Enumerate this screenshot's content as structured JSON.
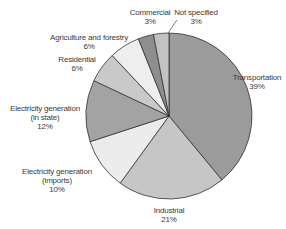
{
  "chart_data": {
    "type": "pie",
    "title": "",
    "start_angle_deg": 0,
    "direction": "clockwise",
    "center": [
      169,
      116
    ],
    "radius": 83,
    "slices": [
      {
        "name": "Transportation",
        "value": 39,
        "label": "39%",
        "color": "#9b9b9b"
      },
      {
        "name": "Industrial",
        "value": 21,
        "label": "21%",
        "color": "#c6c6c6"
      },
      {
        "name": "Electricity generation (imports)",
        "value": 10,
        "label": "10%",
        "color": "#ececec"
      },
      {
        "name": "Electricity generation (in state)",
        "value": 12,
        "label": "12%",
        "color": "#a3a3a3"
      },
      {
        "name": "Residential",
        "value": 6,
        "label": "6%",
        "color": "#c9c9c9"
      },
      {
        "name": "Agriculture and forestry",
        "value": 6,
        "label": "6%",
        "color": "#eeeeee"
      },
      {
        "name": "Commercial",
        "value": 3,
        "label": "3%",
        "color": "#8e8e8e"
      },
      {
        "name": "Not specified",
        "value": 3,
        "label": "3%",
        "color": "#c2c2c2"
      }
    ]
  },
  "labels": {
    "transportation": {
      "line1": "Transportation",
      "pct": "39%"
    },
    "industrial": {
      "line1": "Industrial",
      "pct": "21%"
    },
    "elec_imports": {
      "line1": "Electricity generation",
      "line2": "(imports)",
      "pct": "10%"
    },
    "elec_instate": {
      "line1": "Electricity generation",
      "line2": "(in state)",
      "pct": "12%"
    },
    "residential": {
      "line1": "Residential",
      "pct": "6%"
    },
    "agriculture": {
      "line1": "Agriculture and forestry",
      "pct": "6%"
    },
    "commercial": {
      "line1": "Commercial",
      "pct": "3%"
    },
    "not_specified": {
      "line1": "Not specified",
      "pct": "3%"
    }
  }
}
